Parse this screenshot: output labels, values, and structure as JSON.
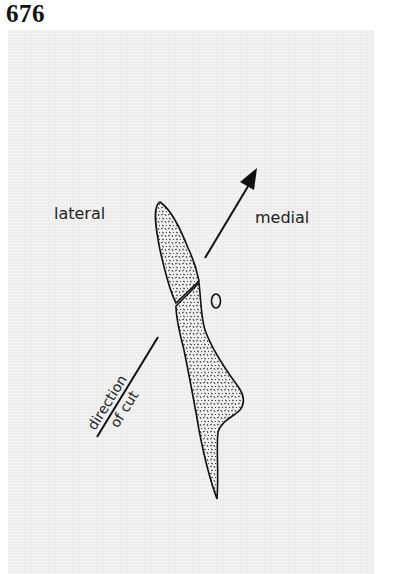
{
  "figure": {
    "number": "676"
  },
  "diagram": {
    "labels": {
      "lateral": "lateral",
      "medial": "medial",
      "direction_line1": "direction",
      "direction_line2": "of cut",
      "marker": "0"
    },
    "elements": [
      {
        "name": "upper-bone-fragment",
        "type": "stippled elongated oval"
      },
      {
        "name": "lower-bone-fragment",
        "type": "stippled tapering shape"
      },
      {
        "name": "medial-arrow",
        "type": "arrow pointing upper-right"
      },
      {
        "name": "cut-direction-line",
        "type": "diagonal line lower-left"
      },
      {
        "name": "small-oval-marker",
        "type": "outline"
      }
    ],
    "colors": {
      "background": "#ebebeb",
      "ink": "#111111"
    }
  }
}
